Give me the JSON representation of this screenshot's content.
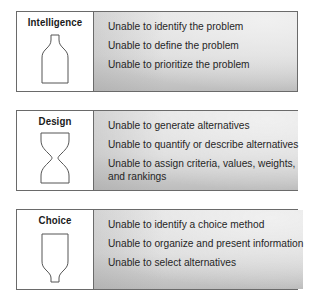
{
  "phases": [
    {
      "title": "Intelligence",
      "icon": "bottle-narrow-top-icon",
      "issues": [
        "Unable to identify the problem",
        "Unable to define the problem",
        "Unable to prioritize the problem"
      ]
    },
    {
      "title": "Design",
      "icon": "hourglass-icon",
      "issues": [
        "Unable to generate alternatives",
        "Unable to quantify or describe alternatives",
        "Unable to assign criteria, values, weights, and rankings"
      ]
    },
    {
      "title": "Choice",
      "icon": "funnel-narrow-bottom-icon",
      "issues": [
        "Unable to identify a choice method",
        "Unable to organize and present information",
        "Unable to select alternatives"
      ]
    }
  ],
  "colors": {
    "border": "#6a6a6a",
    "panel_top": "#e8e8e8",
    "panel_bottom": "#bdbdbd",
    "text": "#262626"
  }
}
